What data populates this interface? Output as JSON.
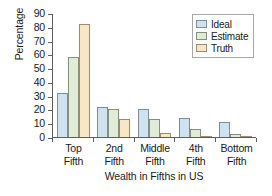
{
  "chart_data": {
    "type": "bar",
    "title": "",
    "xlabel": "Wealth in Fifths in US",
    "ylabel": "Percentage",
    "ylim": [
      0,
      90
    ],
    "yticks": [
      0,
      10,
      20,
      30,
      40,
      50,
      60,
      70,
      80,
      90
    ],
    "grid": false,
    "legend_position": "top-right",
    "categories": [
      "Top Fifth",
      "2nd Fifth",
      "Middle Fifth",
      "4th Fifth",
      "Bottom Fifth"
    ],
    "category_lines": [
      [
        "Top",
        "Fifth"
      ],
      [
        "2nd",
        "Fifth"
      ],
      [
        "Middle",
        "Fifth"
      ],
      [
        "4th",
        "Fifth"
      ],
      [
        "Bottom",
        "Fifth"
      ]
    ],
    "series": [
      {
        "name": "Ideal",
        "color": "#cfe2f0",
        "values": [
          32,
          22,
          20,
          14,
          11
        ]
      },
      {
        "name": "Estimate",
        "color": "#e0ecd8",
        "values": [
          58,
          20,
          13,
          6,
          2
        ]
      },
      {
        "name": "Truth",
        "color": "#f7e7c4",
        "values": [
          82,
          13,
          3,
          0.3,
          0.1
        ]
      }
    ]
  }
}
